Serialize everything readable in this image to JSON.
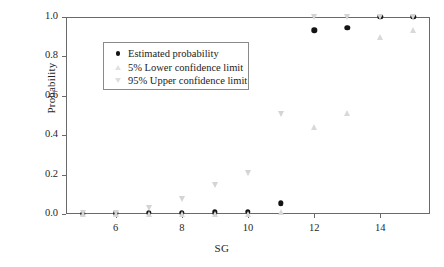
{
  "chart_data": {
    "type": "scatter",
    "title": "",
    "xlabel": "SG",
    "ylabel": "Probability",
    "xlim": [
      4.5,
      15.5
    ],
    "ylim": [
      0.0,
      1.0
    ],
    "grid": false,
    "legend_position": "upper-left-inside",
    "x": [
      5,
      6,
      7,
      8,
      9,
      10,
      11,
      12,
      13,
      14,
      15
    ],
    "xticks": [
      6,
      8,
      10,
      12,
      14
    ],
    "xtick_labels": [
      "6",
      "8",
      "10",
      "12",
      "14"
    ],
    "yticks": [
      0.0,
      0.2,
      0.4,
      0.6,
      0.8,
      1.0
    ],
    "ytick_labels": [
      "0.0",
      "0.2",
      "0.4",
      "0.6",
      "0.8",
      "1.0"
    ],
    "series": [
      {
        "name": "Estimated probability",
        "marker": "filled-circle",
        "color": "#141414",
        "values": [
          0.002,
          0.003,
          0.006,
          0.007,
          0.009,
          0.011,
          0.055,
          0.932,
          0.944,
          1.0,
          1.0
        ]
      },
      {
        "name": "5% Lower confidence limit",
        "marker": "triangle-up",
        "color": "#d9d9d9",
        "values": [
          0.0,
          0.0,
          0.0,
          0.0,
          0.0,
          0.0,
          0.008,
          0.443,
          0.513,
          0.9,
          0.932
        ]
      },
      {
        "name": "95% Upper confidence limit",
        "marker": "triangle-down",
        "color": "#d4d4d4",
        "values": [
          0.003,
          0.005,
          0.029,
          0.076,
          0.148,
          0.207,
          0.508,
          1.0,
          1.0,
          1.0,
          1.0
        ]
      }
    ]
  },
  "legend": {
    "items": [
      {
        "label": "Estimated probability",
        "marker": "filled-circle"
      },
      {
        "label": "5% Lower confidence limit",
        "marker": "triangle-up"
      },
      {
        "label": "95% Upper confidence limit",
        "marker": "triangle-down"
      }
    ]
  },
  "axes": {
    "x_title": "SG",
    "y_title": "Probability"
  }
}
